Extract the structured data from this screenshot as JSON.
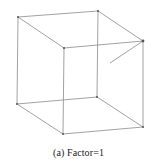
{
  "figure": {
    "caption": "(a) Factor=1",
    "line_color": "#8a8a8a",
    "vertex_color": "#555555",
    "vertices": {
      "back_top_left": [
        18,
        17
      ],
      "back_top_right": [
        98,
        11
      ],
      "front_top_left": [
        64,
        48
      ],
      "front_top_right": [
        143,
        41
      ],
      "back_bottom_left": [
        17,
        104
      ],
      "back_bottom_right": [
        97,
        97
      ],
      "front_bottom_left": [
        63,
        134
      ],
      "front_bottom_right": [
        143,
        127
      ]
    },
    "stub_end": [
      110,
      63
    ]
  }
}
